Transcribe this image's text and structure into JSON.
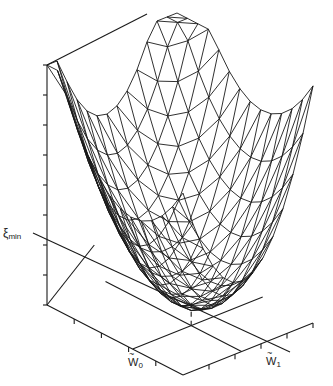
{
  "figure": {
    "type": "3d-surface-wireframe",
    "stroke_color": "#1a1a1a",
    "background": "#ffffff"
  },
  "labels": {
    "z_axis_symbol": "ξ",
    "z_axis_sub": "min",
    "w0_symbol": "W",
    "w0_sub": "0",
    "w1_symbol": "W",
    "w1_sub": "1"
  },
  "chart_data": {
    "type": "surface",
    "function": "xi = xi_min + a*(w0 - w0_opt)^2 + b*(w1 - w1_opt)^2",
    "xlabel": "W̃0",
    "ylabel": "W̃1",
    "zlabel": "ξ",
    "annotations": [
      "ξ min",
      "W̃0",
      "W̃1"
    ],
    "grid_lines_per_axis": 13,
    "z_axis_ticks": 8,
    "w0_axis_ticks": 5,
    "w1_axis_ticks": 5
  }
}
